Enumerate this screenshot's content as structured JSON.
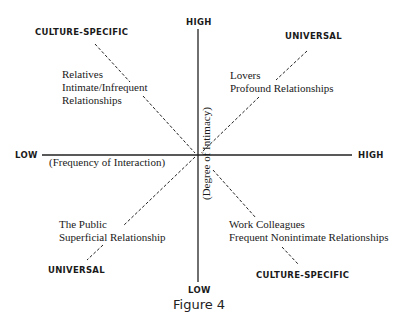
{
  "axes": {
    "vertical": {
      "top_label": "HIGH",
      "bottom_label": "LOW",
      "title": "(Degree of Intimacy)"
    },
    "horizontal": {
      "left_label": "LOW",
      "right_label": "HIGH",
      "title": "(Frequency of Interaction)"
    }
  },
  "quadrants": {
    "top_left": {
      "category": "CULTURE-SPECIFIC",
      "line1": "Relatives",
      "line2": "Intimate/Infrequent",
      "line3": "Relationships"
    },
    "top_right": {
      "category": "UNIVERSAL",
      "line1": "Lovers",
      "line2": "Profound Relationships"
    },
    "bottom_left": {
      "category": "UNIVERSAL",
      "line1": "The Public",
      "line2": "Superficial Relationship"
    },
    "bottom_right": {
      "category": "CULTURE-SPECIFIC",
      "line1": "Work Colleagues",
      "line2": "Frequent Nonintimate Relationships"
    }
  },
  "caption": "Figure 4"
}
